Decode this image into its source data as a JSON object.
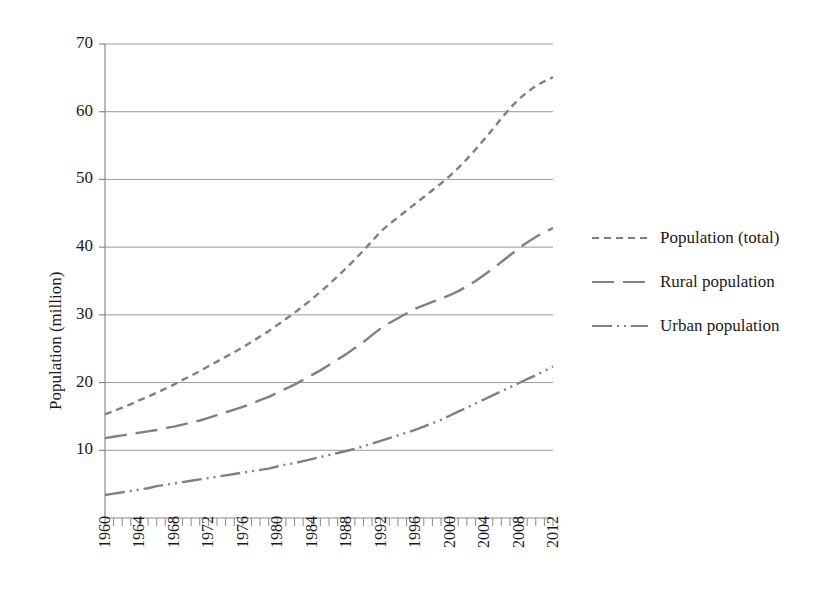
{
  "chart_data": {
    "type": "line",
    "title": "",
    "xlabel": "",
    "ylabel": "Population (million)",
    "xlim": [
      1960,
      2012
    ],
    "ylim": [
      0,
      70
    ],
    "yticks": [
      10,
      20,
      30,
      40,
      50,
      60,
      70
    ],
    "grid": true,
    "legend_position": "right",
    "x": [
      1960,
      1961,
      1962,
      1963,
      1964,
      1965,
      1966,
      1967,
      1968,
      1969,
      1970,
      1971,
      1972,
      1973,
      1974,
      1975,
      1976,
      1977,
      1978,
      1979,
      1980,
      1981,
      1982,
      1983,
      1984,
      1985,
      1986,
      1987,
      1988,
      1989,
      1990,
      1991,
      1992,
      1993,
      1994,
      1995,
      1996,
      1997,
      1998,
      1999,
      2000,
      2001,
      2002,
      2003,
      2004,
      2005,
      2006,
      2007,
      2008,
      2009,
      2010,
      2011,
      2012
    ],
    "xticks_labeled": [
      "1960",
      "1964",
      "1968",
      "1972",
      "1976",
      "1980",
      "1984",
      "1988",
      "1992",
      "1996",
      "2000",
      "2004",
      "2008",
      "2012"
    ],
    "series": [
      {
        "name": "Population (total)",
        "style": "dashed",
        "color": "#808080",
        "values": [
          15.3,
          15.8,
          16.3,
          16.8,
          17.4,
          17.9,
          18.5,
          19.1,
          19.7,
          20.4,
          21.0,
          21.7,
          22.4,
          23.1,
          23.8,
          24.5,
          25.2,
          26.0,
          26.8,
          27.6,
          28.5,
          29.4,
          30.3,
          31.3,
          32.3,
          33.4,
          34.5,
          35.7,
          36.9,
          38.2,
          39.5,
          40.9,
          42.3,
          43.4,
          44.4,
          45.4,
          46.4,
          47.4,
          48.4,
          49.4,
          50.5,
          51.7,
          53.0,
          54.4,
          55.9,
          57.4,
          59.0,
          60.5,
          61.8,
          62.9,
          63.8,
          64.5,
          65.1
        ]
      },
      {
        "name": "Rural population",
        "style": "long-dashed",
        "color": "#808080",
        "values": [
          11.8,
          12.0,
          12.2,
          12.4,
          12.6,
          12.8,
          13.0,
          13.3,
          13.5,
          13.8,
          14.1,
          14.4,
          14.8,
          15.2,
          15.6,
          16.0,
          16.4,
          16.9,
          17.4,
          17.9,
          18.5,
          19.1,
          19.7,
          20.4,
          21.1,
          21.8,
          22.6,
          23.4,
          24.2,
          25.1,
          26.0,
          27.0,
          28.0,
          28.8,
          29.5,
          30.2,
          30.9,
          31.4,
          31.9,
          32.4,
          32.9,
          33.5,
          34.2,
          35.0,
          35.9,
          36.8,
          37.8,
          38.8,
          39.8,
          40.7,
          41.5,
          42.2,
          42.8
        ]
      },
      {
        "name": "Urban population",
        "style": "dash-dot-dot",
        "color": "#808080",
        "values": [
          3.4,
          3.6,
          3.8,
          4.0,
          4.2,
          4.4,
          4.7,
          4.9,
          5.1,
          5.3,
          5.5,
          5.7,
          5.9,
          6.1,
          6.3,
          6.5,
          6.7,
          6.9,
          7.1,
          7.3,
          7.6,
          7.9,
          8.1,
          8.4,
          8.7,
          9.0,
          9.3,
          9.6,
          9.9,
          10.2,
          10.6,
          11.0,
          11.4,
          11.8,
          12.2,
          12.6,
          13.0,
          13.5,
          14.0,
          14.5,
          15.1,
          15.7,
          16.3,
          16.9,
          17.5,
          18.1,
          18.7,
          19.3,
          19.9,
          20.5,
          21.1,
          21.7,
          22.4
        ]
      }
    ]
  },
  "legend": {
    "entries": [
      {
        "label": "Population (total)"
      },
      {
        "label": "Rural population"
      },
      {
        "label": "Urban population"
      }
    ]
  },
  "axes": {
    "y_title": "Population (million)"
  }
}
